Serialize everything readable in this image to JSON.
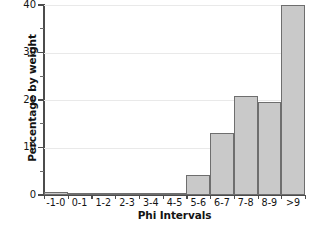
{
  "chart_data": {
    "type": "bar",
    "title": "",
    "xlabel": "Phi Intervals",
    "ylabel": "Percentage by weight",
    "categories": [
      "-1-0",
      "0-1",
      "1-2",
      "2-3",
      "3-4",
      "4-5",
      "5-6",
      "6-7",
      "7-8",
      "8-9",
      ">9"
    ],
    "values": [
      0.6,
      0.4,
      0.25,
      0.2,
      0.3,
      0.1,
      4.3,
      13.1,
      20.8,
      19.6,
      40.0
    ],
    "ylim": [
      0,
      40
    ],
    "xlim_categories": 11,
    "y_major_ticks": [
      0,
      10,
      20,
      30,
      40
    ],
    "y_minor_ticks": [
      5,
      15,
      25,
      35
    ],
    "y_tick_labels": [
      "0",
      "10",
      "20",
      "30",
      "40"
    ],
    "grid": true,
    "grid_axis": "y",
    "legend": false,
    "legend_position": "none",
    "bar_fill_color": "#c9c9c9",
    "bar_edge_color": "#6e6e6e",
    "axis_color": "#4c4c4c",
    "grid_color": "#e9e9e9",
    "text_color": "#131313",
    "background_color": "#ffffff"
  }
}
